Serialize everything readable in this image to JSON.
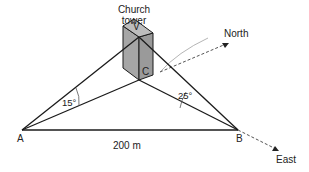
{
  "diagram": {
    "title_label": {
      "line1": "Church",
      "line2": "tower"
    },
    "points": {
      "A": "A",
      "B": "B",
      "C": "C",
      "V": "V"
    },
    "angles": {
      "at_A": "15°",
      "at_B": "25°"
    },
    "baseline_length": "200 m",
    "directions": {
      "north": "North",
      "east": "East"
    },
    "colors": {
      "line": "#1a1a1a",
      "tower_fill": "#a6a6a6",
      "tower_top": "#bdbdbd",
      "guide": "#b0b0b0",
      "dashed": "#555555"
    }
  }
}
